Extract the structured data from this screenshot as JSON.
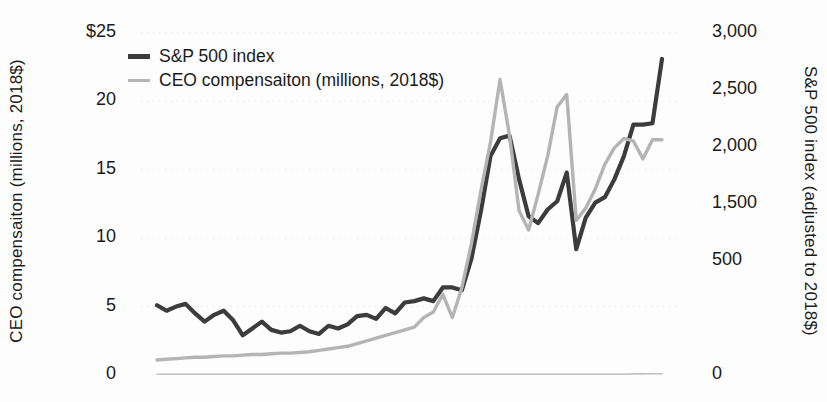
{
  "chart_data": {
    "type": "line",
    "title": "",
    "subtitle": "",
    "ylabel": "CEO compensaiton (millions, 2018$)",
    "y2label": "S&P 500 index (adjusted to 2018$)",
    "xlabel": "",
    "ylim": [
      0,
      25
    ],
    "y2lim": [
      0,
      3000
    ],
    "yticks": [
      "$25",
      "20",
      "15",
      "10",
      "5",
      "0"
    ],
    "ytick_values": [
      25,
      20,
      15,
      10,
      5,
      0
    ],
    "y2ticks": [
      "3,000",
      "2,500",
      "2,000",
      "1,500",
      "500",
      "0"
    ],
    "y2tick_values": [
      3000,
      2500,
      2000,
      1500,
      1000,
      0
    ],
    "xticks": [],
    "grid": "faint-horizontal-dotted",
    "legend_position": "top-left",
    "series": [
      {
        "name": "S&P 500 index",
        "color": "#3c3c3c",
        "width": 4.2,
        "axis": "right",
        "unit": "index (2018$)",
        "values": [
          5.1,
          4.7,
          5.0,
          5.2,
          4.5,
          3.9,
          4.4,
          4.7,
          4.0,
          2.9,
          3.4,
          3.9,
          3.3,
          3.1,
          3.2,
          3.6,
          3.2,
          3.0,
          3.6,
          3.4,
          3.7,
          4.3,
          4.4,
          4.1,
          4.9,
          4.5,
          5.3,
          5.4,
          5.6,
          5.4,
          6.4,
          6.4,
          6.2,
          8.5,
          12.0,
          16.0,
          17.3,
          17.5,
          14.3,
          11.6,
          11.1,
          12.1,
          12.7,
          14.8,
          9.2,
          11.5,
          12.6,
          13.0,
          14.3,
          16.0,
          18.3,
          18.3,
          18.4,
          23.1
        ]
      },
      {
        "name": "CEO compensaiton (millions, 2018$)",
        "color": "#b4b4b4",
        "width": 3.4,
        "axis": "left",
        "unit": "millions 2018$",
        "values": [
          1.1,
          1.15,
          1.2,
          1.25,
          1.3,
          1.3,
          1.35,
          1.4,
          1.4,
          1.45,
          1.5,
          1.5,
          1.55,
          1.6,
          1.6,
          1.65,
          1.7,
          1.8,
          1.9,
          2.0,
          2.1,
          2.3,
          2.5,
          2.7,
          2.9,
          3.1,
          3.3,
          3.5,
          4.2,
          4.6,
          5.9,
          4.2,
          6.4,
          9.6,
          13.5,
          17.0,
          21.6,
          17.5,
          12.0,
          10.6,
          13.2,
          16.0,
          19.6,
          20.5,
          11.3,
          12.2,
          13.6,
          15.4,
          16.6,
          17.3,
          17.1,
          15.8,
          17.2,
          17.2
        ]
      },
      {
        "name": "baseline",
        "color": "#c0c0c0",
        "width": 1.6,
        "axis": "left",
        "unit": "zero-line",
        "values": [
          0.06,
          0.06,
          0.06,
          0.06,
          0.06,
          0.06,
          0.06,
          0.06,
          0.06,
          0.06,
          0.06,
          0.06,
          0.06,
          0.06,
          0.06,
          0.06,
          0.06,
          0.06,
          0.06,
          0.06,
          0.06,
          0.06,
          0.06,
          0.06,
          0.06,
          0.06,
          0.06,
          0.06,
          0.06,
          0.06,
          0.06,
          0.06,
          0.06,
          0.06,
          0.06,
          0.06,
          0.06,
          0.06,
          0.06,
          0.06,
          0.06,
          0.06,
          0.06,
          0.06,
          0.06,
          0.06,
          0.06,
          0.06,
          0.06,
          0.06,
          0.08,
          0.08,
          0.09,
          0.09
        ]
      }
    ]
  },
  "legend": {
    "items": [
      {
        "label": "S&P 500 index",
        "style": "thick"
      },
      {
        "label": "CEO compensaiton (millions, 2018$)",
        "style": "thin"
      }
    ]
  },
  "axes": {
    "left_title": "CEO compensaiton (millions, 2018$)",
    "right_title": "S&P 500 index (adjusted to 2018$)"
  }
}
